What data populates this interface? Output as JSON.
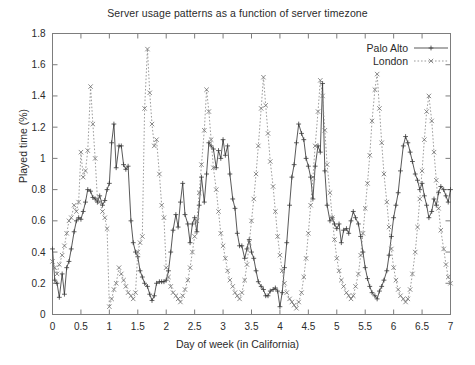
{
  "chart_data": {
    "type": "line",
    "title": "Server usage patterns as a function of server timezone",
    "xlabel": "Day of week (in California)",
    "ylabel": "Played time (%)",
    "xlim": [
      0,
      7
    ],
    "ylim": [
      0,
      1.8
    ],
    "xticks": [
      "0",
      "0.5",
      "1",
      "1.5",
      "2",
      "2.5",
      "3",
      "3.5",
      "4",
      "4.5",
      "5",
      "5.5",
      "6",
      "6.5",
      "7"
    ],
    "xtick_values": [
      0,
      0.5,
      1,
      1.5,
      2,
      2.5,
      3,
      3.5,
      4,
      4.5,
      5,
      5.5,
      6,
      6.5,
      7
    ],
    "yticks": [
      "0",
      "0.2",
      "0.4",
      "0.6",
      "0.8",
      "1",
      "1.2",
      "1.4",
      "1.6",
      "1.8"
    ],
    "ytick_values": [
      0,
      0.2,
      0.4,
      0.6,
      0.8,
      1.0,
      1.2,
      1.4,
      1.6,
      1.8
    ],
    "grid": false,
    "legend_position": "top-right",
    "legend": [
      "Palo Alto",
      "London"
    ],
    "series": [
      {
        "name": "Palo Alto",
        "marker": "plus",
        "linestyle": "solid",
        "color": "#3b3b3b",
        "x": [
          0.0,
          0.04,
          0.08,
          0.12,
          0.17,
          0.21,
          0.25,
          0.29,
          0.33,
          0.38,
          0.42,
          0.46,
          0.5,
          0.54,
          0.58,
          0.62,
          0.67,
          0.71,
          0.75,
          0.79,
          0.83,
          0.88,
          0.92,
          0.96,
          1.0,
          1.04,
          1.08,
          1.12,
          1.17,
          1.21,
          1.25,
          1.29,
          1.33,
          1.38,
          1.42,
          1.46,
          1.5,
          1.54,
          1.58,
          1.62,
          1.67,
          1.71,
          1.75,
          1.79,
          1.83,
          1.88,
          1.92,
          1.96,
          2.0,
          2.04,
          2.08,
          2.12,
          2.17,
          2.21,
          2.25,
          2.29,
          2.33,
          2.38,
          2.42,
          2.46,
          2.5,
          2.54,
          2.58,
          2.62,
          2.67,
          2.71,
          2.75,
          2.79,
          2.83,
          2.88,
          2.92,
          2.96,
          3.0,
          3.04,
          3.08,
          3.12,
          3.17,
          3.21,
          3.25,
          3.29,
          3.33,
          3.38,
          3.42,
          3.46,
          3.5,
          3.54,
          3.58,
          3.62,
          3.67,
          3.71,
          3.75,
          3.79,
          3.83,
          3.88,
          3.92,
          3.96,
          4.0,
          4.04,
          4.08,
          4.12,
          4.17,
          4.21,
          4.25,
          4.29,
          4.33,
          4.38,
          4.42,
          4.46,
          4.5,
          4.54,
          4.58,
          4.62,
          4.67,
          4.71,
          4.75,
          4.79,
          4.83,
          4.88,
          4.92,
          4.96,
          5.0,
          5.04,
          5.08,
          5.12,
          5.17,
          5.21,
          5.25,
          5.29,
          5.33,
          5.38,
          5.42,
          5.46,
          5.5,
          5.54,
          5.58,
          5.62,
          5.67,
          5.71,
          5.75,
          5.79,
          5.83,
          5.88,
          5.92,
          5.96,
          6.0,
          6.04,
          6.08,
          6.12,
          6.17,
          6.21,
          6.25,
          6.29,
          6.33,
          6.38,
          6.42,
          6.46,
          6.5,
          6.54,
          6.58,
          6.62,
          6.67,
          6.71,
          6.75,
          6.79,
          6.83,
          6.88,
          6.92,
          6.96,
          7.0
        ],
        "y": [
          0.42,
          0.22,
          0.2,
          0.11,
          0.26,
          0.13,
          0.3,
          0.34,
          0.42,
          0.53,
          0.6,
          0.62,
          0.61,
          0.66,
          0.72,
          0.8,
          0.79,
          0.75,
          0.74,
          0.72,
          0.76,
          0.7,
          0.73,
          0.8,
          0.84,
          1.1,
          1.22,
          0.94,
          1.08,
          1.08,
          0.96,
          0.93,
          0.95,
          0.6,
          0.46,
          0.4,
          0.37,
          0.28,
          0.24,
          0.2,
          0.18,
          0.13,
          0.09,
          0.12,
          0.2,
          0.21,
          0.21,
          0.21,
          0.22,
          0.28,
          0.4,
          0.54,
          0.64,
          0.56,
          0.72,
          0.84,
          0.64,
          0.58,
          0.46,
          0.58,
          0.62,
          0.53,
          0.7,
          0.88,
          0.72,
          0.9,
          1.1,
          1.08,
          1.06,
          0.94,
          1.05,
          1.0,
          1.12,
          1.02,
          1.08,
          0.9,
          0.74,
          0.68,
          0.52,
          0.44,
          0.44,
          0.36,
          0.42,
          0.48,
          0.4,
          0.36,
          0.28,
          0.21,
          0.18,
          0.16,
          0.12,
          0.12,
          0.15,
          0.16,
          0.17,
          0.15,
          0.05,
          0.14,
          0.3,
          0.46,
          0.7,
          0.88,
          0.96,
          1.1,
          1.22,
          1.16,
          1.12,
          1.0,
          0.95,
          0.88,
          0.74,
          0.95,
          1.08,
          1.04,
          1.48,
          0.92,
          0.7,
          0.6,
          0.62,
          0.58,
          0.55,
          0.58,
          0.46,
          0.54,
          0.55,
          0.52,
          0.6,
          0.66,
          0.62,
          0.58,
          0.5,
          0.4,
          0.3,
          0.23,
          0.18,
          0.14,
          0.12,
          0.1,
          0.15,
          0.18,
          0.22,
          0.28,
          0.38,
          0.5,
          0.62,
          0.7,
          0.78,
          0.92,
          1.08,
          1.14,
          1.1,
          1.04,
          0.98,
          0.9,
          0.86,
          0.8,
          0.84,
          0.76,
          0.7,
          0.62,
          0.66,
          0.74,
          0.7,
          0.78,
          0.82,
          0.8,
          0.76,
          0.72,
          0.8
        ]
      },
      {
        "name": "London",
        "marker": "cross",
        "linestyle": "dotted",
        "color": "#6e6e6e",
        "x": [
          0.0,
          0.04,
          0.08,
          0.12,
          0.17,
          0.21,
          0.25,
          0.29,
          0.33,
          0.38,
          0.42,
          0.46,
          0.5,
          0.54,
          0.58,
          0.62,
          0.67,
          0.71,
          0.75,
          0.79,
          0.83,
          0.88,
          0.92,
          0.96,
          1.0,
          1.04,
          1.08,
          1.12,
          1.17,
          1.21,
          1.25,
          1.29,
          1.33,
          1.38,
          1.42,
          1.46,
          1.5,
          1.54,
          1.58,
          1.62,
          1.67,
          1.71,
          1.75,
          1.79,
          1.83,
          1.88,
          1.92,
          1.96,
          2.0,
          2.04,
          2.08,
          2.12,
          2.17,
          2.21,
          2.25,
          2.29,
          2.33,
          2.38,
          2.42,
          2.46,
          2.5,
          2.54,
          2.58,
          2.62,
          2.67,
          2.71,
          2.75,
          2.79,
          2.83,
          2.88,
          2.92,
          2.96,
          3.0,
          3.04,
          3.08,
          3.12,
          3.17,
          3.21,
          3.25,
          3.29,
          3.33,
          3.38,
          3.42,
          3.46,
          3.5,
          3.54,
          3.58,
          3.62,
          3.67,
          3.71,
          3.75,
          3.79,
          3.83,
          3.88,
          3.92,
          3.96,
          4.0,
          4.04,
          4.08,
          4.12,
          4.17,
          4.21,
          4.25,
          4.29,
          4.33,
          4.38,
          4.42,
          4.46,
          4.5,
          4.54,
          4.58,
          4.62,
          4.67,
          4.71,
          4.75,
          4.79,
          4.83,
          4.88,
          4.92,
          4.96,
          5.0,
          5.04,
          5.08,
          5.12,
          5.17,
          5.21,
          5.25,
          5.29,
          5.33,
          5.38,
          5.42,
          5.46,
          5.5,
          5.54,
          5.58,
          5.62,
          5.67,
          5.71,
          5.75,
          5.79,
          5.83,
          5.88,
          5.92,
          5.96,
          6.0,
          6.04,
          6.08,
          6.12,
          6.17,
          6.21,
          6.25,
          6.29,
          6.33,
          6.38,
          6.42,
          6.46,
          6.5,
          6.54,
          6.58,
          6.62,
          6.67,
          6.71,
          6.75,
          6.79,
          6.83,
          6.88,
          6.92,
          6.96,
          7.0
        ],
        "y": [
          0.34,
          0.3,
          0.26,
          0.32,
          0.38,
          0.44,
          0.52,
          0.6,
          0.62,
          0.7,
          0.66,
          0.72,
          1.04,
          0.88,
          0.92,
          1.05,
          1.46,
          1.22,
          1.0,
          0.74,
          0.72,
          0.66,
          0.62,
          0.55,
          0.05,
          0.1,
          0.16,
          0.2,
          0.3,
          0.26,
          0.22,
          0.18,
          0.14,
          0.12,
          0.1,
          0.14,
          0.4,
          0.46,
          0.5,
          1.32,
          1.7,
          1.42,
          1.22,
          1.08,
          1.12,
          0.9,
          0.7,
          0.62,
          0.3,
          0.24,
          0.18,
          0.14,
          0.12,
          0.1,
          0.08,
          0.12,
          0.16,
          0.22,
          0.3,
          0.4,
          0.5,
          0.6,
          0.78,
          0.96,
          1.18,
          1.44,
          1.3,
          1.12,
          0.94,
          0.8,
          0.66,
          0.52,
          0.44,
          0.36,
          0.28,
          0.22,
          0.18,
          0.14,
          0.12,
          0.1,
          0.14,
          0.22,
          0.32,
          0.46,
          0.6,
          0.74,
          0.9,
          1.08,
          1.32,
          1.52,
          1.34,
          1.16,
          0.98,
          0.82,
          0.66,
          0.5,
          0.38,
          0.28,
          0.2,
          0.14,
          0.1,
          0.08,
          0.06,
          0.04,
          0.08,
          0.14,
          0.24,
          0.36,
          0.52,
          0.7,
          0.88,
          1.08,
          1.3,
          1.5,
          1.4,
          1.18,
          0.96,
          0.78,
          0.62,
          0.48,
          0.36,
          0.28,
          0.22,
          0.18,
          0.14,
          0.12,
          0.1,
          0.12,
          0.18,
          0.26,
          0.38,
          0.52,
          0.68,
          0.84,
          1.02,
          1.24,
          1.44,
          1.54,
          1.32,
          1.1,
          0.9,
          0.72,
          0.56,
          0.42,
          0.3,
          0.22,
          0.16,
          0.12,
          0.1,
          0.08,
          0.1,
          0.16,
          0.26,
          0.4,
          0.56,
          0.74,
          0.92,
          1.12,
          1.3,
          1.4,
          1.24,
          1.04,
          0.86,
          0.68,
          0.54,
          0.42,
          0.32,
          0.24,
          0.2
        ]
      }
    ]
  }
}
